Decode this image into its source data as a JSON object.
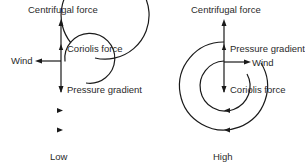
{
  "diagrams": [
    {
      "id": "low",
      "caption": "Low",
      "labels": {
        "top": "Centrifugal force",
        "outer_force": "Coriolis force",
        "wind": "Wind",
        "inner_force": "Pressure gradient"
      },
      "circulation": "counterclockwise"
    },
    {
      "id": "high",
      "caption": "High",
      "labels": {
        "top": "Centrifugal force",
        "outer_force": "Pressure gradient",
        "wind": "Wind",
        "inner_force": "Coriolis force"
      },
      "circulation": "clockwise"
    }
  ],
  "colors": {
    "line": "#1a1a1a",
    "text": "#2a2a2a",
    "background": "#ffffff"
  }
}
